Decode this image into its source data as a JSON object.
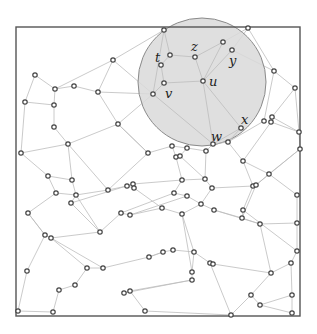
{
  "figure": {
    "width": 317,
    "height": 334,
    "frame": {
      "x": 16,
      "y": 27,
      "w": 284,
      "h": 289
    },
    "circle": {
      "cx": 202,
      "cy": 82,
      "r": 64,
      "fill": "#d9d9d9",
      "stroke": "#8a8a8a"
    },
    "edge_color": "#bdbdbd",
    "node_stroke": "#444444",
    "node_radius": 2.2
  },
  "labels": [
    {
      "id": "t",
      "text": "t",
      "x": 155,
      "y": 62
    },
    {
      "id": "z",
      "text": "z",
      "x": 191,
      "y": 51
    },
    {
      "id": "y",
      "text": "y",
      "x": 229,
      "y": 65
    },
    {
      "id": "u",
      "text": "u",
      "x": 209,
      "y": 86
    },
    {
      "id": "v",
      "text": "v",
      "x": 165,
      "y": 98
    },
    {
      "id": "x",
      "text": "x",
      "x": 241,
      "y": 124
    },
    {
      "id": "w",
      "text": "w",
      "x": 211,
      "y": 141
    }
  ],
  "nodes": [
    [
      164,
      30
    ],
    [
      248,
      28
    ],
    [
      223,
      42
    ],
    [
      232,
      50
    ],
    [
      170,
      55
    ],
    [
      161,
      65
    ],
    [
      195,
      57
    ],
    [
      164,
      83
    ],
    [
      203,
      81
    ],
    [
      153,
      94
    ],
    [
      274,
      71
    ],
    [
      295,
      88
    ],
    [
      113,
      60
    ],
    [
      35,
      75
    ],
    [
      55,
      89
    ],
    [
      74,
      86
    ],
    [
      98,
      92
    ],
    [
      25,
      102
    ],
    [
      54,
      105
    ],
    [
      54,
      127
    ],
    [
      118,
      124
    ],
    [
      68,
      144
    ],
    [
      21,
      153
    ],
    [
      241,
      128
    ],
    [
      264,
      121
    ],
    [
      272,
      117
    ],
    [
      271,
      122
    ],
    [
      213,
      144
    ],
    [
      228,
      142
    ],
    [
      299,
      132
    ],
    [
      300,
      149
    ],
    [
      148,
      153
    ],
    [
      172,
      146
    ],
    [
      187,
      148
    ],
    [
      176,
      157
    ],
    [
      180,
      156
    ],
    [
      206,
      151
    ],
    [
      243,
      161
    ],
    [
      269,
      174
    ],
    [
      48,
      176
    ],
    [
      72,
      180
    ],
    [
      56,
      193
    ],
    [
      76,
      195
    ],
    [
      108,
      190
    ],
    [
      71,
      203
    ],
    [
      28,
      213
    ],
    [
      127,
      186
    ],
    [
      133,
      184
    ],
    [
      134,
      188
    ],
    [
      182,
      180
    ],
    [
      205,
      179
    ],
    [
      212,
      188
    ],
    [
      253,
      186
    ],
    [
      256,
      185
    ],
    [
      174,
      193
    ],
    [
      187,
      196
    ],
    [
      201,
      204
    ],
    [
      214,
      210
    ],
    [
      243,
      210
    ],
    [
      242,
      218
    ],
    [
      260,
      224
    ],
    [
      297,
      195
    ],
    [
      297,
      223
    ],
    [
      121,
      213
    ],
    [
      130,
      215
    ],
    [
      162,
      208
    ],
    [
      182,
      214
    ],
    [
      100,
      232
    ],
    [
      45,
      235
    ],
    [
      51,
      238
    ],
    [
      27,
      271
    ],
    [
      87,
      268
    ],
    [
      103,
      268
    ],
    [
      59,
      290
    ],
    [
      75,
      285
    ],
    [
      18,
      311
    ],
    [
      53,
      312
    ],
    [
      149,
      257
    ],
    [
      163,
      252
    ],
    [
      173,
      250
    ],
    [
      194,
      252
    ],
    [
      192,
      272
    ],
    [
      192,
      280
    ],
    [
      124,
      293
    ],
    [
      130,
      291
    ],
    [
      145,
      311
    ],
    [
      210,
      263
    ],
    [
      213,
      264
    ],
    [
      297,
      251
    ],
    [
      291,
      263
    ],
    [
      271,
      273
    ],
    [
      251,
      295
    ],
    [
      260,
      305
    ],
    [
      292,
      295
    ],
    [
      231,
      315
    ],
    [
      292,
      313
    ]
  ],
  "edges": [
    [
      0,
      4
    ],
    [
      0,
      12
    ],
    [
      0,
      9
    ],
    [
      1,
      2
    ],
    [
      1,
      3
    ],
    [
      1,
      10
    ],
    [
      2,
      6
    ],
    [
      2,
      8
    ],
    [
      3,
      8
    ],
    [
      3,
      10
    ],
    [
      4,
      6
    ],
    [
      4,
      5
    ],
    [
      5,
      7
    ],
    [
      6,
      8
    ],
    [
      7,
      8
    ],
    [
      7,
      9
    ],
    [
      8,
      27
    ],
    [
      8,
      23
    ],
    [
      9,
      12
    ],
    [
      9,
      16
    ],
    [
      9,
      20
    ],
    [
      9,
      27
    ],
    [
      12,
      16
    ],
    [
      10,
      11
    ],
    [
      10,
      24
    ],
    [
      11,
      29
    ],
    [
      11,
      25
    ],
    [
      13,
      14
    ],
    [
      14,
      15
    ],
    [
      15,
      16
    ],
    [
      14,
      18
    ],
    [
      13,
      17
    ],
    [
      17,
      18
    ],
    [
      18,
      19
    ],
    [
      19,
      21
    ],
    [
      17,
      22
    ],
    [
      16,
      20
    ],
    [
      20,
      21
    ],
    [
      20,
      31
    ],
    [
      21,
      22
    ],
    [
      21,
      40
    ],
    [
      21,
      43
    ],
    [
      22,
      39
    ],
    [
      23,
      27
    ],
    [
      23,
      28
    ],
    [
      24,
      28
    ],
    [
      26,
      29
    ],
    [
      25,
      29
    ],
    [
      29,
      30
    ],
    [
      27,
      28
    ],
    [
      27,
      36
    ],
    [
      28,
      37
    ],
    [
      26,
      37
    ],
    [
      30,
      38
    ],
    [
      30,
      53
    ],
    [
      31,
      32
    ],
    [
      32,
      33
    ],
    [
      33,
      36
    ],
    [
      31,
      43
    ],
    [
      32,
      34
    ],
    [
      33,
      35
    ],
    [
      34,
      49
    ],
    [
      35,
      50
    ],
    [
      36,
      50
    ],
    [
      37,
      38
    ],
    [
      37,
      52
    ],
    [
      38,
      53
    ],
    [
      38,
      61
    ],
    [
      39,
      40
    ],
    [
      39,
      41
    ],
    [
      40,
      42
    ],
    [
      41,
      42
    ],
    [
      41,
      45
    ],
    [
      42,
      44
    ],
    [
      43,
      42
    ],
    [
      43,
      46
    ],
    [
      44,
      47
    ],
    [
      44,
      67
    ],
    [
      45,
      68
    ],
    [
      46,
      47
    ],
    [
      46,
      48
    ],
    [
      47,
      49
    ],
    [
      49,
      50
    ],
    [
      49,
      54
    ],
    [
      50,
      51
    ],
    [
      51,
      52
    ],
    [
      51,
      56
    ],
    [
      52,
      58
    ],
    [
      53,
      59
    ],
    [
      54,
      55
    ],
    [
      55,
      56
    ],
    [
      54,
      63
    ],
    [
      55,
      64
    ],
    [
      56,
      57
    ],
    [
      57,
      59
    ],
    [
      57,
      60
    ],
    [
      58,
      59
    ],
    [
      59,
      60
    ],
    [
      60,
      62
    ],
    [
      61,
      62
    ],
    [
      63,
      64
    ],
    [
      48,
      65
    ],
    [
      64,
      65
    ],
    [
      65,
      66
    ],
    [
      66,
      56
    ],
    [
      66,
      81
    ],
    [
      63,
      67
    ],
    [
      67,
      69
    ],
    [
      68,
      70
    ],
    [
      68,
      69
    ],
    [
      69,
      71
    ],
    [
      69,
      72
    ],
    [
      70,
      75
    ],
    [
      71,
      72
    ],
    [
      71,
      74
    ],
    [
      72,
      77
    ],
    [
      73,
      74
    ],
    [
      73,
      76
    ],
    [
      75,
      76
    ],
    [
      77,
      78
    ],
    [
      78,
      79
    ],
    [
      79,
      80
    ],
    [
      80,
      66
    ],
    [
      78,
      77
    ],
    [
      80,
      86
    ],
    [
      80,
      81
    ],
    [
      81,
      82
    ],
    [
      82,
      83
    ],
    [
      82,
      84
    ],
    [
      83,
      84
    ],
    [
      84,
      85
    ],
    [
      85,
      94
    ],
    [
      86,
      87
    ],
    [
      86,
      94
    ],
    [
      87,
      90
    ],
    [
      88,
      89
    ],
    [
      88,
      62
    ],
    [
      89,
      90
    ],
    [
      89,
      93
    ],
    [
      90,
      91
    ],
    [
      91,
      92
    ],
    [
      92,
      93
    ],
    [
      92,
      95
    ],
    [
      93,
      95
    ],
    [
      94,
      91
    ],
    [
      60,
      90
    ],
    [
      58,
      88
    ],
    [
      42,
      67
    ],
    [
      68,
      45
    ],
    [
      31,
      20
    ],
    [
      12,
      14
    ]
  ]
}
